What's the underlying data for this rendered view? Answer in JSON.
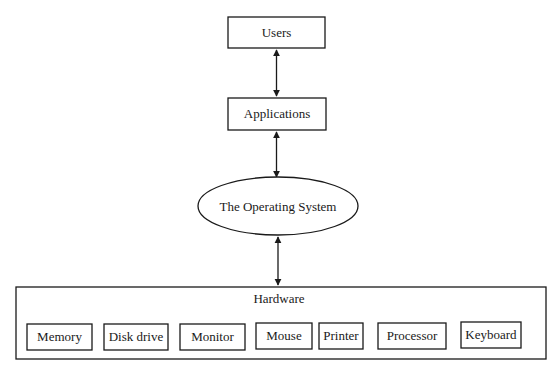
{
  "diagram": {
    "nodes": {
      "users": {
        "label": "Users"
      },
      "applications": {
        "label": "Applications"
      },
      "os": {
        "label": "The Operating System"
      },
      "hardware": {
        "label": "Hardware",
        "components": [
          {
            "label": "Memory"
          },
          {
            "label": "Disk drive"
          },
          {
            "label": "Monitor"
          },
          {
            "label": "Mouse"
          },
          {
            "label": "Printer"
          },
          {
            "label": "Processor"
          },
          {
            "label": "Keyboard"
          }
        ]
      }
    },
    "edges": [
      {
        "from": "Users",
        "to": "Applications",
        "type": "bidirectional"
      },
      {
        "from": "Applications",
        "to": "The Operating System",
        "type": "bidirectional"
      },
      {
        "from": "The Operating System",
        "to": "Hardware",
        "type": "bidirectional"
      }
    ],
    "colors": {
      "stroke": "#1a1a1a",
      "background": "#ffffff"
    }
  }
}
